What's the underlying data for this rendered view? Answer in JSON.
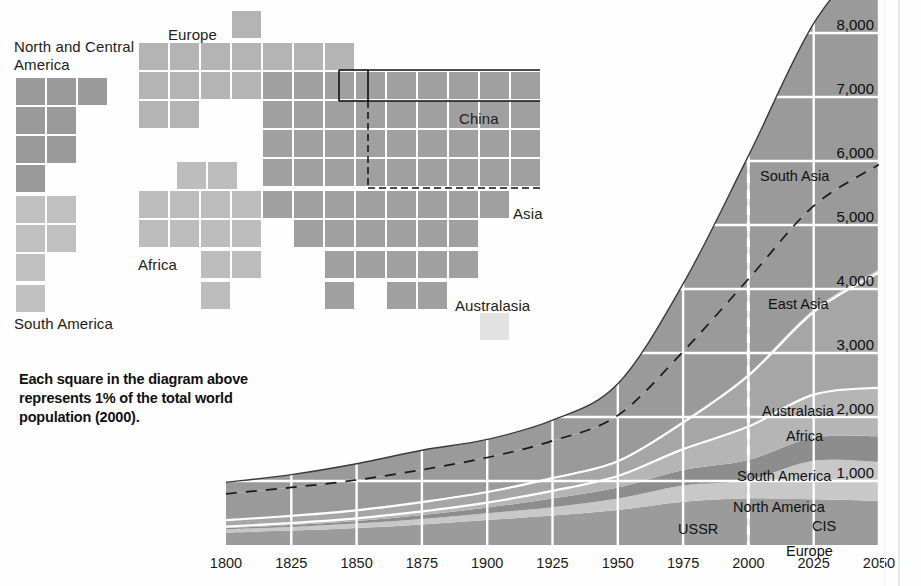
{
  "waffle": {
    "note": "Each square = 1% of total world population (2000)",
    "labels": [
      {
        "text": "North and Central\nAmerica",
        "x": 14,
        "y": 38
      },
      {
        "text": "South America",
        "x": 14,
        "y": 315
      },
      {
        "text": "Europe",
        "x": 168,
        "y": 26
      },
      {
        "text": "Africa",
        "x": 138,
        "y": 256
      },
      {
        "text": "Asia",
        "x": 513,
        "y": 205
      },
      {
        "text": "China",
        "x": 459,
        "y": 110
      },
      {
        "text": "Australasia",
        "x": 455,
        "y": 297
      }
    ],
    "colors": {
      "north_america": "#9a9a9a",
      "south_america": "#c0c0c0",
      "europe": "#b4b4b4",
      "africa": "#bdbdbd",
      "asia": "#a0a0a0",
      "china": "#9a9a9a",
      "australasia": "#e2e2e2",
      "outline": "#111111"
    },
    "squares": [
      {
        "g": "na",
        "x": 16,
        "y": 78
      },
      {
        "g": "na",
        "x": 47,
        "y": 78
      },
      {
        "g": "na",
        "x": 78,
        "y": 78
      },
      {
        "g": "na",
        "x": 16,
        "y": 107
      },
      {
        "g": "na",
        "x": 47,
        "y": 107
      },
      {
        "g": "na",
        "x": 16,
        "y": 136
      },
      {
        "g": "na",
        "x": 47,
        "y": 136
      },
      {
        "g": "na",
        "x": 16,
        "y": 165
      },
      {
        "g": "sa",
        "x": 16,
        "y": 196
      },
      {
        "g": "sa",
        "x": 47,
        "y": 196
      },
      {
        "g": "sa",
        "x": 16,
        "y": 225
      },
      {
        "g": "sa",
        "x": 47,
        "y": 225
      },
      {
        "g": "sa",
        "x": 16,
        "y": 254
      },
      {
        "g": "sa",
        "x": 16,
        "y": 285
      },
      {
        "g": "eu",
        "x": 232,
        "y": 11
      },
      {
        "g": "eu",
        "x": 139,
        "y": 43
      },
      {
        "g": "eu",
        "x": 170,
        "y": 43
      },
      {
        "g": "eu",
        "x": 201,
        "y": 43
      },
      {
        "g": "eu",
        "x": 232,
        "y": 43
      },
      {
        "g": "eu",
        "x": 263,
        "y": 43
      },
      {
        "g": "eu",
        "x": 294,
        "y": 43
      },
      {
        "g": "eu",
        "x": 325,
        "y": 43
      },
      {
        "g": "eu",
        "x": 139,
        "y": 72
      },
      {
        "g": "eu",
        "x": 170,
        "y": 72
      },
      {
        "g": "eu",
        "x": 201,
        "y": 72
      },
      {
        "g": "eu",
        "x": 232,
        "y": 72
      },
      {
        "g": "eu",
        "x": 139,
        "y": 101
      },
      {
        "g": "eu",
        "x": 170,
        "y": 101
      },
      {
        "g": "af",
        "x": 177,
        "y": 162
      },
      {
        "g": "af",
        "x": 208,
        "y": 162
      },
      {
        "g": "af",
        "x": 139,
        "y": 191
      },
      {
        "g": "af",
        "x": 170,
        "y": 191
      },
      {
        "g": "af",
        "x": 201,
        "y": 191
      },
      {
        "g": "af",
        "x": 232,
        "y": 191
      },
      {
        "g": "af",
        "x": 139,
        "y": 220
      },
      {
        "g": "af",
        "x": 170,
        "y": 220
      },
      {
        "g": "af",
        "x": 201,
        "y": 220
      },
      {
        "g": "af",
        "x": 232,
        "y": 220
      },
      {
        "g": "af",
        "x": 201,
        "y": 251
      },
      {
        "g": "af",
        "x": 232,
        "y": 251
      },
      {
        "g": "af",
        "x": 201,
        "y": 282
      },
      {
        "g": "as",
        "x": 263,
        "y": 72
      },
      {
        "g": "as",
        "x": 294,
        "y": 72
      },
      {
        "g": "as",
        "x": 325,
        "y": 72
      },
      {
        "g": "as",
        "x": 356,
        "y": 72
      },
      {
        "g": "as",
        "x": 387,
        "y": 72
      },
      {
        "g": "as",
        "x": 418,
        "y": 72
      },
      {
        "g": "as",
        "x": 449,
        "y": 72
      },
      {
        "g": "as",
        "x": 480,
        "y": 72
      },
      {
        "g": "as",
        "x": 511,
        "y": 72
      },
      {
        "g": "as",
        "x": 263,
        "y": 101
      },
      {
        "g": "as",
        "x": 294,
        "y": 101
      },
      {
        "g": "as",
        "x": 325,
        "y": 101
      },
      {
        "g": "as",
        "x": 356,
        "y": 101
      },
      {
        "g": "as",
        "x": 387,
        "y": 101
      },
      {
        "g": "as",
        "x": 418,
        "y": 101
      },
      {
        "g": "as",
        "x": 449,
        "y": 101
      },
      {
        "g": "as",
        "x": 480,
        "y": 101
      },
      {
        "g": "as",
        "x": 511,
        "y": 101
      },
      {
        "g": "as",
        "x": 263,
        "y": 130
      },
      {
        "g": "as",
        "x": 294,
        "y": 130
      },
      {
        "g": "as",
        "x": 325,
        "y": 130
      },
      {
        "g": "as",
        "x": 356,
        "y": 130
      },
      {
        "g": "as",
        "x": 387,
        "y": 130
      },
      {
        "g": "as",
        "x": 418,
        "y": 130
      },
      {
        "g": "as",
        "x": 449,
        "y": 130
      },
      {
        "g": "as",
        "x": 480,
        "y": 130
      },
      {
        "g": "as",
        "x": 511,
        "y": 130
      },
      {
        "g": "as",
        "x": 263,
        "y": 159
      },
      {
        "g": "as",
        "x": 294,
        "y": 159
      },
      {
        "g": "as",
        "x": 325,
        "y": 159
      },
      {
        "g": "as",
        "x": 356,
        "y": 159
      },
      {
        "g": "as",
        "x": 387,
        "y": 159
      },
      {
        "g": "as",
        "x": 418,
        "y": 159
      },
      {
        "g": "as",
        "x": 449,
        "y": 159
      },
      {
        "g": "as",
        "x": 480,
        "y": 159
      },
      {
        "g": "as",
        "x": 511,
        "y": 159
      },
      {
        "g": "as",
        "x": 263,
        "y": 191
      },
      {
        "g": "as",
        "x": 294,
        "y": 191
      },
      {
        "g": "as",
        "x": 325,
        "y": 191
      },
      {
        "g": "as",
        "x": 356,
        "y": 191
      },
      {
        "g": "as",
        "x": 387,
        "y": 191
      },
      {
        "g": "as",
        "x": 418,
        "y": 191
      },
      {
        "g": "as",
        "x": 449,
        "y": 191
      },
      {
        "g": "as",
        "x": 480,
        "y": 191
      },
      {
        "g": "as",
        "x": 294,
        "y": 220
      },
      {
        "g": "as",
        "x": 325,
        "y": 220
      },
      {
        "g": "as",
        "x": 356,
        "y": 220
      },
      {
        "g": "as",
        "x": 387,
        "y": 220
      },
      {
        "g": "as",
        "x": 418,
        "y": 220
      },
      {
        "g": "as",
        "x": 449,
        "y": 220
      },
      {
        "g": "as",
        "x": 325,
        "y": 251
      },
      {
        "g": "as",
        "x": 356,
        "y": 251
      },
      {
        "g": "as",
        "x": 387,
        "y": 251
      },
      {
        "g": "as",
        "x": 418,
        "y": 251
      },
      {
        "g": "as",
        "x": 449,
        "y": 251
      },
      {
        "g": "as",
        "x": 325,
        "y": 282
      },
      {
        "g": "as",
        "x": 387,
        "y": 282
      },
      {
        "g": "as",
        "x": 418,
        "y": 282
      },
      {
        "g": "aus",
        "x": 480,
        "y": 313
      }
    ]
  },
  "caption": {
    "line1": "Each square in the diagram above",
    "line2": "represents 1% of the total world",
    "line3": "population (2000)."
  },
  "chart_data": {
    "type": "area",
    "title": "",
    "xlabel": "",
    "ylabel": "",
    "x": [
      1800,
      1825,
      1850,
      1875,
      1900,
      1925,
      1950,
      1975,
      2000,
      2025,
      2050
    ],
    "xlim": [
      1800,
      2050
    ],
    "ylim": [
      0,
      9400
    ],
    "ytick_labels": [
      "1,000",
      "2,000",
      "3,000",
      "4,000",
      "5,000",
      "6,000",
      "7,000",
      "8,000",
      "9,000"
    ],
    "yticks": [
      1000,
      2000,
      3000,
      4000,
      5000,
      6000,
      7000,
      8000,
      9000
    ],
    "xtick_labels": [
      "1800",
      "1825",
      "1850",
      "1875",
      "1900",
      "1925",
      "1950",
      "1975",
      "2000",
      "2025",
      "2050"
    ],
    "grid": true,
    "legend_position": "inline-labels",
    "projection_marker_year": 2000,
    "totals": [
      980,
      1100,
      1270,
      1480,
      1650,
      1950,
      2520,
      4080,
      6080,
      7850,
      9100
    ],
    "series": [
      {
        "name": "Europe",
        "values": [
          195,
          225,
          265,
          320,
          390,
          460,
          545,
          675,
          730,
          715,
          690
        ]
      },
      {
        "name": "USSR",
        "values": [
          50,
          58,
          70,
          85,
          105,
          130,
          180,
          255,
          290,
          300,
          305
        ]
      },
      {
        "name": "CIS",
        "values": [
          0,
          0,
          0,
          0,
          0,
          0,
          0,
          0,
          0,
          300,
          305
        ]
      },
      {
        "name": "North America",
        "values": [
          18,
          28,
          40,
          62,
          90,
          135,
          172,
          243,
          310,
          365,
          400
        ]
      },
      {
        "name": "South America",
        "values": [
          25,
          33,
          42,
          58,
          78,
          120,
          180,
          325,
          520,
          670,
          760
        ]
      },
      {
        "name": "Africa",
        "values": [
          100,
          112,
          125,
          145,
          165,
          200,
          230,
          415,
          795,
          1290,
          1800
        ]
      },
      {
        "name": "Australasia",
        "values": [
          2,
          3,
          4,
          6,
          9,
          13,
          18,
          25,
          31,
          38,
          44
        ]
      },
      {
        "name": "East Asia",
        "values": [
          410,
          440,
          470,
          500,
          530,
          570,
          700,
          1085,
          1480,
          1620,
          1640
        ]
      },
      {
        "name": "South Asia",
        "values": [
          180,
          201,
          254,
          304,
          283,
          322,
          495,
          1057,
          1924,
          2852,
          3456
        ]
      }
    ],
    "inline_labels": [
      {
        "text": "South Asia",
        "x": 760,
        "y": 168
      },
      {
        "text": "East Asia",
        "x": 768,
        "y": 296
      },
      {
        "text": "Australasia",
        "x": 762,
        "y": 403
      },
      {
        "text": "Africa",
        "x": 786,
        "y": 428
      },
      {
        "text": "South America",
        "x": 737,
        "y": 468
      },
      {
        "text": "North America",
        "x": 733,
        "y": 499
      },
      {
        "text": "USSR",
        "x": 678,
        "y": 521
      },
      {
        "text": "CIS",
        "x": 812,
        "y": 518
      },
      {
        "text": "Europe",
        "x": 786,
        "y": 543
      }
    ],
    "colors": {
      "europe": "#9b9b9b",
      "ussr": "#c8c8c8",
      "cis": "#c8c8c8",
      "north_america": "#8d8d8d",
      "south_america": "#b5b5b5",
      "africa": "#a6a6a6",
      "australasia": "#cfcfcf",
      "east_asia": "#9a9a9a",
      "south_asia": "#9a9a9a",
      "gridline": "#ffffff",
      "divider_dash": "#1a1a1a",
      "projection_line": "#ffffff",
      "outline": "#3a3a3a"
    }
  }
}
